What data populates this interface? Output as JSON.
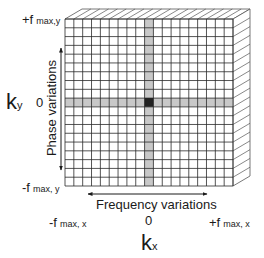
{
  "diagram": {
    "title": "",
    "grid": {
      "rows": 19,
      "cols": 19,
      "highlight_row": 9,
      "highlight_col": 9
    },
    "colors": {
      "grid_line": "#2a2a2a",
      "band": "#c8c8c8",
      "center_cell": "#222222",
      "hatch": "#555555"
    },
    "y_axis": {
      "label_main": "k",
      "label_sub": "y",
      "top_tick": {
        "sign": "+f",
        "sub": "max,y"
      },
      "mid_tick": "0",
      "bottom_tick": {
        "sign": "-f",
        "sub": "max, y"
      },
      "arrow_label": "Phase variations"
    },
    "x_axis": {
      "label_main": "k",
      "label_sub": "x",
      "left_tick": {
        "sign": "-f",
        "sub": "max, x"
      },
      "mid_tick": "0",
      "right_tick": {
        "sign": "+f",
        "sub": "max, x"
      },
      "arrow_label": "Frequency variations"
    }
  }
}
